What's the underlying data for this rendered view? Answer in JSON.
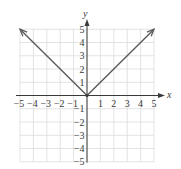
{
  "chart_data": {
    "type": "line",
    "title": "",
    "xlabel": "x",
    "ylabel": "y",
    "xlim": [
      -5,
      5
    ],
    "ylim": [
      -5,
      5
    ],
    "grid": true,
    "x_ticks": [
      -5,
      -4,
      -3,
      -2,
      -1,
      1,
      2,
      3,
      4,
      5
    ],
    "y_ticks": [
      5,
      4,
      3,
      2,
      1,
      -1,
      -2,
      -3,
      -4,
      -5
    ],
    "x_tick_labels": [
      "−5",
      "−4",
      "−3",
      "−2",
      "−1",
      "1",
      "2",
      "3",
      "4",
      "5"
    ],
    "y_tick_labels": [
      "5",
      "4",
      "3",
      "2",
      "1",
      "−1",
      "−2",
      "−3",
      "−4",
      "−5"
    ],
    "series": [
      {
        "name": "y = |x|",
        "x": [
          -5,
          -4,
          -3,
          -2,
          -1,
          0,
          1,
          2,
          3,
          4,
          5
        ],
        "y": [
          5,
          4,
          3,
          2,
          1,
          0,
          1,
          2,
          3,
          4,
          5
        ],
        "arrows_at_ends": true,
        "vertex_point": [
          0,
          0
        ]
      }
    ]
  },
  "colors": {
    "grid": "#dcdcdc",
    "axis": "#3a3a3a",
    "curve": "#5a5a5a",
    "text": "#3a3a3a"
  }
}
